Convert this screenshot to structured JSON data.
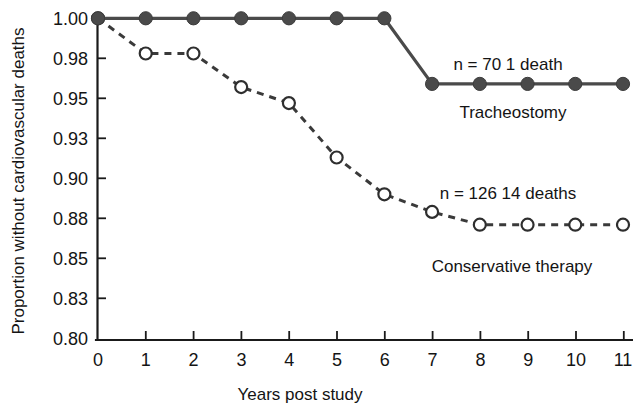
{
  "chart_data": {
    "type": "line",
    "title": "",
    "subtitle": "",
    "xlabel": "Years post study",
    "ylabel": "Proportion without cardiovascular deaths",
    "x": [
      0,
      1,
      2,
      3,
      4,
      5,
      6,
      7,
      8,
      9,
      10,
      11
    ],
    "xlim": [
      0,
      11
    ],
    "ylim": [
      0.8,
      1.0
    ],
    "xticks": [
      "0",
      "1",
      "2",
      "3",
      "4",
      "5",
      "6",
      "7",
      "8",
      "9",
      "10",
      "11"
    ],
    "yticks": [
      "1.00",
      "0.98",
      "0.95",
      "0.93",
      "0.90",
      "0.88",
      "0.85",
      "0.83",
      "0.80"
    ],
    "ytick_values": [
      1.0,
      0.975,
      0.95,
      0.925,
      0.9,
      0.875,
      0.85,
      0.825,
      0.8
    ],
    "grid": false,
    "legend_position": "inline-annotations",
    "series": [
      {
        "name": "Tracheostomy",
        "marker": "filled-circle",
        "line_style": "solid",
        "color": "#4a4a4a",
        "x": [
          0,
          1,
          2,
          3,
          4,
          5,
          6,
          7,
          8,
          9,
          10,
          11
        ],
        "values": [
          1.0,
          1.0,
          1.0,
          1.0,
          1.0,
          1.0,
          1.0,
          0.959,
          0.959,
          0.959,
          0.959,
          0.959
        ],
        "annotation": "n = 70   1 death",
        "n": 70,
        "deaths": 1
      },
      {
        "name": "Conservative therapy",
        "marker": "open-circle",
        "line_style": "dashed",
        "color": "#3a3a3a",
        "x": [
          0,
          1,
          2,
          3,
          4,
          5,
          6,
          7,
          8,
          9,
          10,
          11
        ],
        "values": [
          1.0,
          0.978,
          0.978,
          0.957,
          0.947,
          0.913,
          0.89,
          0.879,
          0.871,
          0.871,
          0.871,
          0.871
        ],
        "annotation": "n = 126  14 deaths",
        "n": 126,
        "deaths": 14
      }
    ],
    "annotations": [
      {
        "id": "tracheostomy-stats",
        "text": "n = 70   1 death"
      },
      {
        "id": "tracheostomy-name",
        "text": "Tracheostomy"
      },
      {
        "id": "conservative-stats",
        "text": "n = 126  14 deaths"
      },
      {
        "id": "conservative-name",
        "text": "Conservative therapy"
      }
    ],
    "colors": {
      "axis": "#1a1a1a",
      "tracheostomy": "#4a4a4a",
      "conservative": "#3a3a3a",
      "background": "#ffffff"
    }
  }
}
